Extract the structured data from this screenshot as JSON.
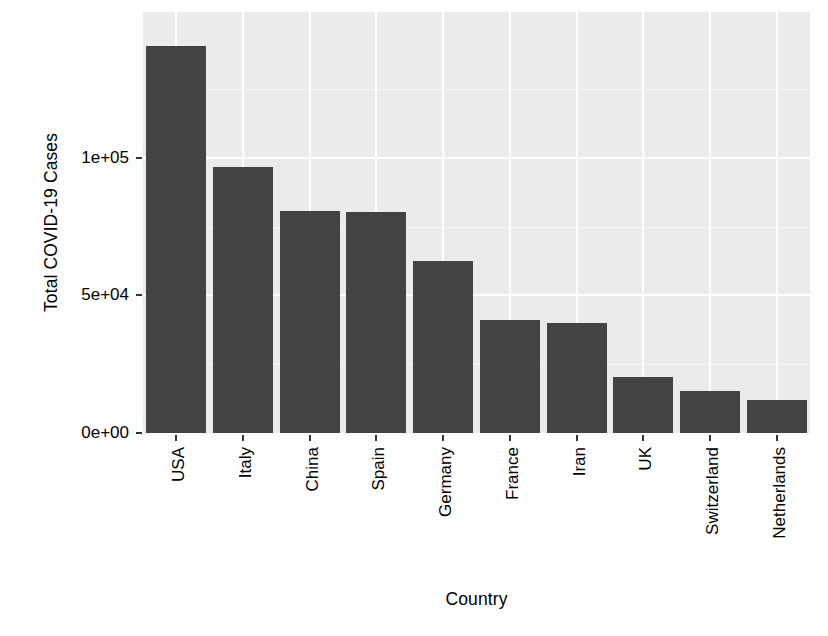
{
  "chart_data": {
    "type": "bar",
    "title": "",
    "subtitle": "",
    "xlabel": "Country",
    "ylabel": "Total COVID-19 Cases",
    "categories": [
      "USA",
      "Italy",
      "China",
      "Spain",
      "Germany",
      "France",
      "Iran",
      "UK",
      "Switzerland",
      "Netherlands"
    ],
    "values": [
      140700,
      96700,
      80700,
      80400,
      62500,
      41100,
      40000,
      20400,
      15300,
      12000
    ],
    "ylim": [
      0,
      153000
    ],
    "y_ticks": [
      0,
      50000,
      100000
    ],
    "y_tick_labels": [
      "0e+00",
      "5e+04",
      "1e+05"
    ],
    "y_minor_ticks": [
      25000,
      75000,
      125000
    ],
    "grid": true,
    "legend": "none",
    "orientation": "vertical",
    "bar_color": "#434343",
    "panel_background": "#ebebeb",
    "gridline_color": "#ffffff",
    "plot_background": "#ffffff",
    "x_tick_label_rotation": -90
  }
}
